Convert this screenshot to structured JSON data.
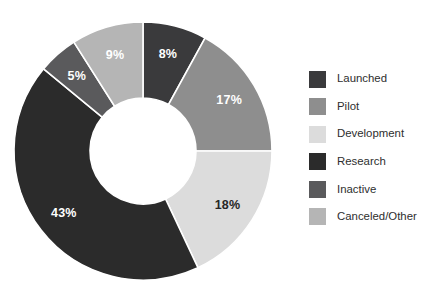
{
  "background_color": "#ffffff",
  "chart_data": {
    "type": "pie",
    "variant": "donut",
    "title": "",
    "xlabel": "",
    "ylabel": "",
    "grid": false,
    "legend_position": "right",
    "start_angle_deg": 0,
    "direction": "clockwise",
    "center": {
      "x": 143,
      "y": 151
    },
    "outer_radius": 129,
    "inner_radius": 53,
    "value_unit": "%",
    "total": 100,
    "categories": [
      "Launched",
      "Pilot",
      "Development",
      "Research",
      "Inactive",
      "Canceled/Other"
    ],
    "values": [
      8,
      17,
      18,
      43,
      5,
      9
    ],
    "data_labels": [
      "8%",
      "17%",
      "18%",
      "43%",
      "5%",
      "9%"
    ],
    "colors": [
      "#3a3a3c",
      "#8e8e8e",
      "#dcdcdc",
      "#2b2b2b",
      "#5a5a5c",
      "#b5b5b5"
    ],
    "label_colors": [
      "#ffffff",
      "#ffffff",
      "#262626",
      "#ffffff",
      "#ffffff",
      "#ffffff"
    ],
    "slices": [
      {
        "name": "Launched",
        "value": 8,
        "label": "8%",
        "color": "#3a3a3c",
        "label_color": "#ffffff"
      },
      {
        "name": "Pilot",
        "value": 17,
        "label": "17%",
        "color": "#8e8e8e",
        "label_color": "#ffffff"
      },
      {
        "name": "Development",
        "value": 18,
        "label": "18%",
        "color": "#dcdcdc",
        "label_color": "#262626"
      },
      {
        "name": "Research",
        "value": 43,
        "label": "43%",
        "color": "#2b2b2b",
        "label_color": "#ffffff"
      },
      {
        "name": "Inactive",
        "value": 5,
        "label": "5%",
        "color": "#5a5a5c",
        "label_color": "#ffffff"
      },
      {
        "name": "Canceled/Other",
        "value": 9,
        "label": "9%",
        "color": "#b5b5b5",
        "label_color": "#ffffff"
      }
    ]
  },
  "legend": {
    "items": [
      {
        "label": "Launched",
        "color": "#3a3a3c",
        "swatch_icon": "legend-swatch-icon"
      },
      {
        "label": "Pilot",
        "color": "#8e8e8e",
        "swatch_icon": "legend-swatch-icon"
      },
      {
        "label": "Development",
        "color": "#dcdcdc",
        "swatch_icon": "legend-swatch-icon"
      },
      {
        "label": "Research",
        "color": "#2b2b2b",
        "swatch_icon": "legend-swatch-icon"
      },
      {
        "label": "Inactive",
        "color": "#5a5a5c",
        "swatch_icon": "legend-swatch-icon"
      },
      {
        "label": "Canceled/Other",
        "color": "#b5b5b5",
        "swatch_icon": "legend-swatch-icon"
      }
    ]
  }
}
